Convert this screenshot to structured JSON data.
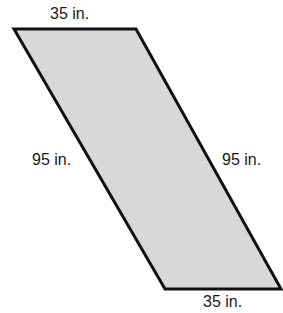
{
  "figure": {
    "shape": "parallelogram",
    "fill_color": "#d8d8d8",
    "stroke_color": "#111111",
    "vertices": [
      [
        14,
        29
      ],
      [
        136,
        29
      ],
      [
        281,
        289
      ],
      [
        165,
        289
      ]
    ]
  },
  "labels": {
    "top": "35 in.",
    "bottom": "35 in.",
    "left": "95 in.",
    "right": "95 in."
  }
}
